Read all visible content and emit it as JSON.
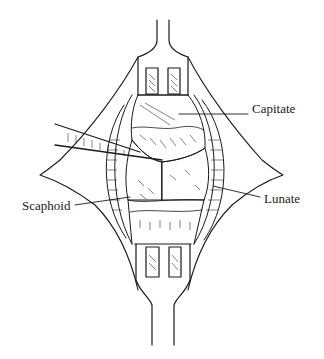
{
  "figure": {
    "labels": [
      {
        "id": "capitate",
        "text": "Capitate",
        "x": 252,
        "y": 102
      },
      {
        "id": "lunate",
        "text": "Lunate",
        "x": 264,
        "y": 192
      },
      {
        "id": "scaphoid",
        "text": "Scaphoid",
        "x": 22,
        "y": 199
      }
    ],
    "colors": {
      "ink": "#1a1a1a",
      "background": "#ffffff"
    }
  }
}
